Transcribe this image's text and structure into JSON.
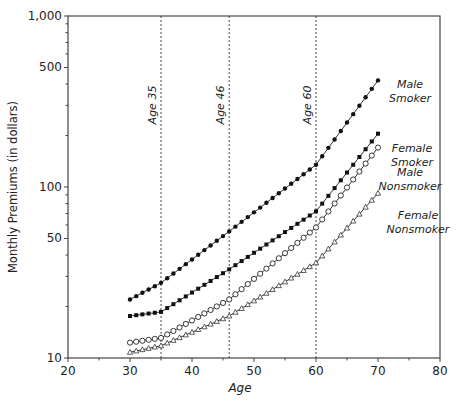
{
  "chart_data": {
    "type": "line",
    "title": "",
    "xlabel": "Age",
    "ylabel": "Monthly Premiums (in dollars)",
    "xlim": [
      20,
      80
    ],
    "ylim": [
      10,
      1000
    ],
    "yscale": "log",
    "x_ticks": [
      20,
      30,
      40,
      50,
      60,
      70,
      80
    ],
    "x_tick_labels": [
      "20",
      "30",
      "40",
      "50",
      "60",
      "70",
      "80"
    ],
    "y_ticks": [
      10,
      50,
      100,
      500,
      1000
    ],
    "y_tick_labels": [
      "10",
      "50",
      "100",
      "500",
      "1,000"
    ],
    "grid": false,
    "legend": "inline labels at right end of each series",
    "annotations": [
      {
        "type": "vline",
        "x": 35,
        "label": "Age 35",
        "style": "dotted"
      },
      {
        "type": "vline",
        "x": 46,
        "label": "Age 46",
        "style": "dotted"
      },
      {
        "type": "vline",
        "x": 60,
        "label": "Age 60",
        "style": "dotted"
      }
    ],
    "x_range": {
      "start": 30,
      "end": 70,
      "step": 1
    },
    "series": [
      {
        "name": "Male Smoker",
        "label_lines": [
          "Male",
          "Smoker"
        ],
        "marker": "filled-circle",
        "knots": {
          "x": [
            30,
            35,
            46,
            60,
            70
          ],
          "y": [
            22,
            27.5,
            55,
            135,
            420
          ]
        }
      },
      {
        "name": "Female Smoker",
        "label_lines": [
          "Female",
          "Smoker"
        ],
        "marker": "filled-square",
        "knots": {
          "x": [
            30,
            35,
            46,
            60,
            70
          ],
          "y": [
            17.6,
            18.6,
            33,
            72,
            205
          ]
        }
      },
      {
        "name": "Male Nonsmoker",
        "label_lines": [
          "Male",
          "Nonsmoker"
        ],
        "marker": "open-circle",
        "knots": {
          "x": [
            30,
            35,
            46,
            60,
            70
          ],
          "y": [
            12.3,
            13.1,
            22,
            58,
            170
          ]
        }
      },
      {
        "name": "Female Nonsmoker",
        "label_lines": [
          "Female",
          "Nonsmoker"
        ],
        "marker": "open-triangle",
        "knots": {
          "x": [
            30,
            35,
            46,
            60,
            70
          ],
          "y": [
            10.8,
            11.8,
            17.6,
            36,
            92
          ]
        }
      }
    ]
  },
  "layout_labels": {
    "series_label_positions": [
      {
        "x": 410,
        "y1": 88,
        "y2": 102
      },
      {
        "x": 412,
        "y1": 152,
        "y2": 166
      },
      {
        "x": 410,
        "y1": 176,
        "y2": 190
      },
      {
        "x": 418,
        "y1": 219,
        "y2": 233
      }
    ]
  }
}
